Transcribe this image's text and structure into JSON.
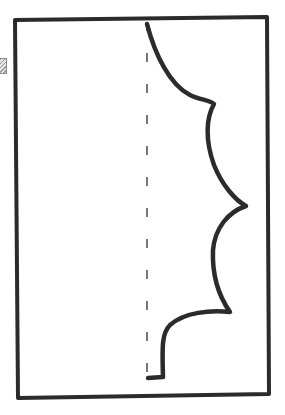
{
  "diagram": {
    "type": "paper-cutting-template",
    "elements": {
      "paper_sheet": "rectangle",
      "fold_line": "dashed vertical line",
      "cut_outline": "scalloped half-shape with four points"
    },
    "colors": {
      "stroke": "#2b2b2b",
      "fold_line": "#555555",
      "background": "#ffffff"
    }
  }
}
